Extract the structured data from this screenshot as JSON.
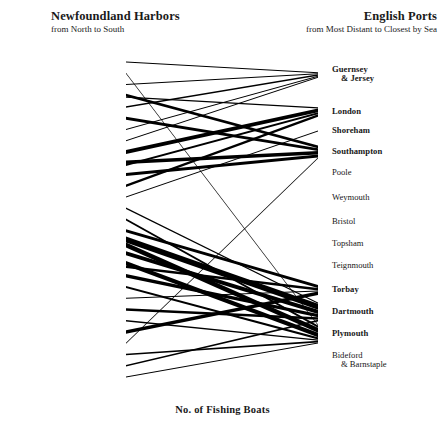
{
  "header": {
    "left_title": "Newfoundland Harbors",
    "left_subtitle": "from North to South",
    "right_title": "English Ports",
    "right_subtitle": "from Most Distant to Closest by Sea"
  },
  "caption": "No. of Fishing Boats",
  "colors": {
    "ink": "#000000",
    "text": "#171717",
    "background": "#ffffff"
  },
  "chart_data": {
    "type": "sankey",
    "title": "No. of Fishing Boats",
    "xlabel": "",
    "ylabel": "",
    "left_axis_label": "Newfoundland Harbors",
    "left_axis_order": "from North to South",
    "right_axis_label": "English Ports",
    "right_axis_order": "from Most Distant to Closest by Sea",
    "left_nodes": [
      "Bonavista",
      "English Hr.",
      "Salmon Cove",
      "Trinity",
      "Bonaventure",
      "Scilly Cove",
      "New Perlican",
      "Old Perlican",
      "Bay de Verde",
      "Carbonear",
      "Harbour Grace",
      "Bay Roberts",
      "Cupids",
      "Brigus",
      "Bell Island",
      "Torbay",
      "St. John's",
      "Petty Hr.",
      "Bay Bulls",
      "Witless Bay",
      "Isles of Spear",
      "Brigus South",
      "Cape Broyle",
      "Caplin Bay",
      "Ferryland",
      "Aquafort",
      "Fermeuse",
      "Renews",
      "Trepassey"
    ],
    "right_nodes": [
      "Guernsey & Jersey",
      "London",
      "Shoreham",
      "Southampton",
      "Poole",
      "Weymouth",
      "Bristol",
      "Topsham",
      "Teignmouth",
      "Torbay",
      "Dartmouth",
      "Plymouth",
      "Bideford & Barnstaple"
    ],
    "right_nodes_with_flows": [
      "Guernsey & Jersey",
      "London",
      "Shoreham",
      "Southampton",
      "Torbay",
      "Dartmouth",
      "Plymouth"
    ],
    "right_nodes_without_flows": [
      "Poole",
      "Weymouth",
      "Bristol",
      "Topsham",
      "Teignmouth",
      "Bideford & Barnstaple"
    ],
    "value_unit": "fishing boats",
    "links": [
      {
        "source": "Bonavista",
        "target": "Guernsey & Jersey",
        "value": 2
      },
      {
        "source": "English Hr.",
        "target": "Plymouth",
        "value": 2
      },
      {
        "source": "Salmon Cove",
        "target": "Guernsey & Jersey",
        "value": 2
      },
      {
        "source": "Trinity",
        "target": "Southampton",
        "value": 6
      },
      {
        "source": "Trinity",
        "target": "London",
        "value": 3
      },
      {
        "source": "Bonaventure",
        "target": "Guernsey & Jersey",
        "value": 3
      },
      {
        "source": "Scilly Cove",
        "target": "Southampton",
        "value": 7
      },
      {
        "source": "New Perlican",
        "target": "Guernsey & Jersey",
        "value": 2
      },
      {
        "source": "Old Perlican",
        "target": "Guernsey & Jersey",
        "value": 2
      },
      {
        "source": "Bay de Verde",
        "target": "London",
        "value": 9
      },
      {
        "source": "Carbonear",
        "target": "Southampton",
        "value": 8
      },
      {
        "source": "Carbonear",
        "target": "London",
        "value": 5
      },
      {
        "source": "Harbour Grace",
        "target": "Southampton",
        "value": 7
      },
      {
        "source": "Bay Roberts",
        "target": "London",
        "value": 6
      },
      {
        "source": "Cupids",
        "target": "Shoreham",
        "value": 2
      },
      {
        "source": "Brigus",
        "target": "Dartmouth",
        "value": 3
      },
      {
        "source": "Bell Island",
        "target": "Plymouth",
        "value": 5
      },
      {
        "source": "Torbay",
        "target": "Torbay",
        "value": 7
      },
      {
        "source": "St. John's",
        "target": "Dartmouth",
        "value": 14
      },
      {
        "source": "St. John's",
        "target": "Plymouth",
        "value": 12
      },
      {
        "source": "Petty Hr.",
        "target": "Dartmouth",
        "value": 10
      },
      {
        "source": "Bay Bulls",
        "target": "Plymouth",
        "value": 11
      },
      {
        "source": "Bay Bulls",
        "target": "Torbay",
        "value": 6
      },
      {
        "source": "Witless Bay",
        "target": "Dartmouth",
        "value": 8
      },
      {
        "source": "Isles of Spear",
        "target": "Plymouth",
        "value": 5
      },
      {
        "source": "Brigus South",
        "target": "Torbay",
        "value": 2
      },
      {
        "source": "Cape Broyle",
        "target": "Dartmouth",
        "value": 6
      },
      {
        "source": "Caplin Bay",
        "target": "Plymouth",
        "value": 3
      },
      {
        "source": "Ferryland",
        "target": "Torbay",
        "value": 8
      },
      {
        "source": "Aquafort",
        "target": "Southampton",
        "value": 2
      },
      {
        "source": "Fermeuse",
        "target": "Plymouth",
        "value": 4
      },
      {
        "source": "Renews",
        "target": "Dartmouth",
        "value": 4
      },
      {
        "source": "Trepassey",
        "target": "Plymouth",
        "value": 2
      }
    ]
  }
}
